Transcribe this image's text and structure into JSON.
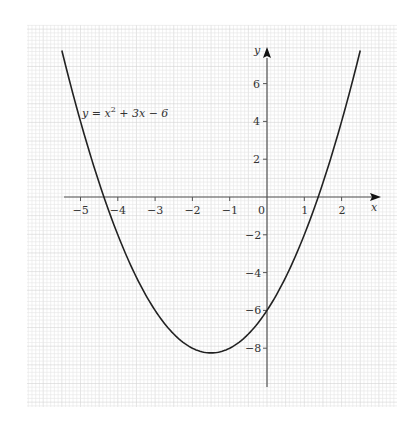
{
  "chart_data": {
    "type": "line",
    "title": "",
    "annotation": "y = x² + 3x − 6",
    "function": "x^2 + 3x - 6",
    "xlabel": "x",
    "ylabel": "y",
    "xlim": [
      -5.5,
      2.5
    ],
    "ylim": [
      -9.8,
      7.5
    ],
    "x_ticks": [
      -5,
      -4,
      -3,
      -2,
      -1,
      0,
      1,
      2
    ],
    "y_ticks": [
      -8,
      -6,
      -4,
      -2,
      2,
      4,
      6
    ],
    "x_tick_labels": [
      "−5",
      "−4",
      "−3",
      "−2",
      "−1",
      "0",
      "1",
      "2"
    ],
    "y_tick_labels": [
      "−8",
      "−6",
      "−4",
      "−2",
      "2",
      "4",
      "6"
    ],
    "grid": true,
    "series": [
      {
        "name": "y = x^2 + 3x - 6",
        "x": [
          -5.5,
          -5,
          -4.372,
          -4,
          -3,
          -2,
          -1.5,
          -1,
          0,
          1,
          1.372,
          2,
          2.5
        ],
        "y": [
          7.75,
          4,
          0,
          -2,
          -6,
          -8,
          -8.25,
          -8,
          -6,
          -2,
          0,
          4,
          7.75
        ]
      }
    ],
    "roots": [
      -4.372,
      1.372
    ],
    "vertex": [
      -1.5,
      -8.25
    ],
    "y_intercept": -6
  },
  "labels": {
    "equation_prefix": "y = x",
    "equation_exp": "2",
    "equation_suffix": " + 3x − 6",
    "x_axis": "x",
    "y_axis": "y",
    "origin": "0"
  },
  "colors": {
    "grid_minor": "#e6e6e6",
    "grid_major": "#d4d4d4",
    "axis": "#555555",
    "curve": "#222222",
    "background": "#ffffff"
  }
}
